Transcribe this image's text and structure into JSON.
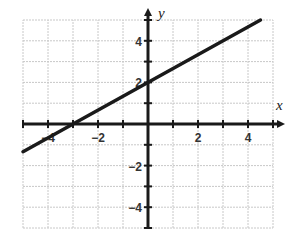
{
  "chart_data": {
    "type": "line",
    "title": "",
    "xlabel": "x",
    "ylabel": "y",
    "xlim": [
      -5,
      5
    ],
    "ylim": [
      -5,
      5
    ],
    "grid": true,
    "x_ticks": [
      -4,
      -2,
      2,
      4
    ],
    "y_ticks": [
      4,
      2,
      -2,
      -4
    ],
    "x_tick_labels": [
      "-4",
      "-2",
      "2",
      "4"
    ],
    "y_tick_labels": [
      "4",
      "2",
      "-2",
      "-4"
    ],
    "series": [
      {
        "name": "line",
        "equation": "y = (2/3)x + 2",
        "slope": 0.6667,
        "intercept": 2,
        "x": [
          -5,
          4.5
        ],
        "y": [
          -1.333,
          5
        ]
      }
    ],
    "key_points": [
      {
        "label": "x-intercept",
        "x": -3,
        "y": 0
      },
      {
        "label": "y-intercept",
        "x": 0,
        "y": 2
      }
    ]
  }
}
